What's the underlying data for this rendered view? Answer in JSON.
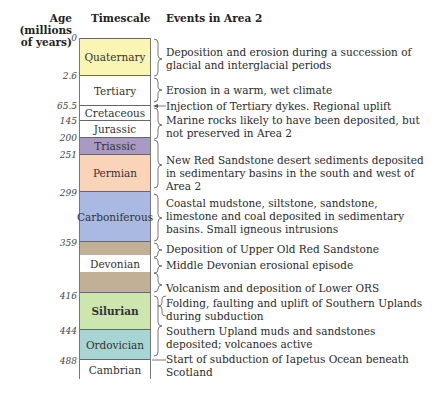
{
  "headers": {
    "age": "Age (millions of years)",
    "age_line1": "Age",
    "age_line2": "(millions",
    "age_line3": "of years)",
    "timescale": "Timescale",
    "events": "Events in Area 2"
  },
  "ages": [
    "0",
    "2.6",
    "65.5",
    "145",
    "200",
    "251",
    "299",
    "359",
    "416",
    "444",
    "488"
  ],
  "periods": [
    {
      "name": "Quaternary",
      "color": "#fbf5b4",
      "bold": false
    },
    {
      "name": "Tertiary",
      "color": "#ffffff",
      "bold": false
    },
    {
      "name": "Cretaceous",
      "color": "#ffffff",
      "bold": false
    },
    {
      "name": "Jurassic",
      "color": "#ffffff",
      "bold": false
    },
    {
      "name": "Triassic",
      "color": "#a99ac4",
      "bold": false
    },
    {
      "name": "Permian",
      "color": "#fbd3b8",
      "bold": false
    },
    {
      "name": "Carboniferous",
      "color": "#a9b9e2",
      "bold": false
    },
    {
      "name": "",
      "color": "#c1b095",
      "bold": false
    },
    {
      "name": "Devonian",
      "color": "#ffffff",
      "bold": false
    },
    {
      "name": "",
      "color": "#c1b095",
      "bold": false
    },
    {
      "name": "Silurian",
      "color": "#cde6b0",
      "bold": true
    },
    {
      "name": "Ordovician",
      "color": "#a6d5d3",
      "bold": false
    },
    {
      "name": "Cambrian",
      "color": "#ffffff",
      "bold": false
    }
  ],
  "events": [
    "Deposition and erosion during a succession of glacial and interglacial periods",
    "Erosion in a warm, wet climate",
    "Injection of Tertiary dykes. Regional uplift",
    "Marine rocks likely to have been deposited, but not preserved in Area 2",
    "New Red Sandstone desert sediments deposited in sedimentary basins in the south and west of Area 2",
    "Coastal mudstone, siltstone, sandstone, limestone and coal deposited in sedimentary basins. Small igneous intrusions",
    "Deposition of Upper Old Red Sandstone",
    "Middle Devonian erosional episode",
    "Volcanism and deposition of Lower ORS",
    "Folding, faulting and uplift of Southern Uplands during subduction",
    "Southern Upland muds and sandstones deposited; volcanoes active",
    "Start of subduction of Iapetus Ocean beneath Scotland"
  ]
}
